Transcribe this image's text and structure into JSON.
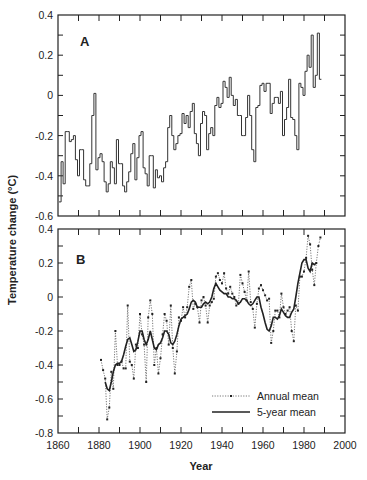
{
  "chart_data": [
    {
      "panel": "A",
      "type": "line",
      "style": "step",
      "title": "A",
      "xlabel": "Year",
      "ylabel": "Temperature change (°C)",
      "xlim": [
        1860,
        2000
      ],
      "ylim": [
        -0.6,
        0.4
      ],
      "yticks": [
        0.4,
        0.2,
        0,
        -0.2,
        -0.4,
        -0.6
      ],
      "ytick_labels": [
        "0.4",
        "0.2",
        "0",
        "-0.2",
        "-0.4",
        "-0.6"
      ],
      "grid": false,
      "series": [
        {
          "name": "Annual",
          "x": [
            1861,
            1862,
            1863,
            1864,
            1865,
            1866,
            1867,
            1868,
            1869,
            1870,
            1871,
            1872,
            1873,
            1874,
            1875,
            1876,
            1877,
            1878,
            1879,
            1880,
            1881,
            1882,
            1883,
            1884,
            1885,
            1886,
            1887,
            1888,
            1889,
            1890,
            1891,
            1892,
            1893,
            1894,
            1895,
            1896,
            1897,
            1898,
            1899,
            1900,
            1901,
            1902,
            1903,
            1904,
            1905,
            1906,
            1907,
            1908,
            1909,
            1910,
            1911,
            1912,
            1913,
            1914,
            1915,
            1916,
            1917,
            1918,
            1919,
            1920,
            1921,
            1922,
            1923,
            1924,
            1925,
            1926,
            1927,
            1928,
            1929,
            1930,
            1931,
            1932,
            1933,
            1934,
            1935,
            1936,
            1937,
            1938,
            1939,
            1940,
            1941,
            1942,
            1943,
            1944,
            1945,
            1946,
            1947,
            1948,
            1949,
            1950,
            1951,
            1952,
            1953,
            1954,
            1955,
            1956,
            1957,
            1958,
            1959,
            1960,
            1961,
            1962,
            1963,
            1964,
            1965,
            1966,
            1967,
            1968,
            1969,
            1970,
            1971,
            1972,
            1973,
            1974,
            1975,
            1976,
            1977,
            1978,
            1979,
            1980,
            1981,
            1982,
            1983,
            1984,
            1985,
            1986,
            1987,
            1988
          ],
          "values": [
            -0.53,
            -0.33,
            -0.44,
            -0.18,
            -0.18,
            -0.23,
            -0.22,
            -0.2,
            -0.32,
            -0.4,
            -0.27,
            -0.27,
            -0.42,
            -0.45,
            -0.45,
            -0.34,
            -0.1,
            0.01,
            -0.37,
            -0.31,
            -0.29,
            -0.33,
            -0.43,
            -0.48,
            -0.44,
            -0.33,
            -0.36,
            -0.44,
            -0.22,
            -0.34,
            -0.34,
            -0.45,
            -0.48,
            -0.43,
            -0.38,
            -0.29,
            -0.24,
            -0.42,
            -0.31,
            -0.2,
            -0.18,
            -0.36,
            -0.39,
            -0.45,
            -0.3,
            -0.3,
            -0.46,
            -0.37,
            -0.41,
            -0.4,
            -0.43,
            -0.36,
            -0.33,
            -0.16,
            -0.1,
            -0.2,
            -0.27,
            -0.24,
            -0.2,
            -0.19,
            -0.09,
            -0.14,
            -0.1,
            -0.16,
            -0.08,
            -0.04,
            -0.19,
            -0.24,
            -0.3,
            -0.14,
            -0.08,
            -0.1,
            -0.27,
            -0.19,
            -0.16,
            -0.2,
            -0.05,
            -0.01,
            -0.06,
            -0.04,
            0.07,
            0.04,
            -0.01,
            0.09,
            0.0,
            -0.05,
            -0.02,
            -0.1,
            -0.1,
            -0.2,
            -0.2,
            -0.11,
            0.0,
            -0.1,
            -0.27,
            -0.33,
            -0.06,
            -0.05,
            0.05,
            0.06,
            0.02,
            0.06,
            0.06,
            -0.09,
            -0.04,
            -0.01,
            -0.01,
            -0.04,
            0.02,
            -0.2,
            -0.12,
            -0.06,
            0.08,
            -0.11,
            -0.12,
            -0.2,
            -0.27,
            0.06,
            0.04,
            0.0,
            0.12,
            0.2,
            0.14,
            0.3,
            0.04,
            0.1,
            0.31,
            0.08,
            0.13,
            0.22,
            0.33
          ]
        }
      ]
    },
    {
      "panel": "B",
      "type": "line",
      "title": "B",
      "xlabel": "Year",
      "ylabel": "Temperature change (°C)",
      "xlim": [
        1860,
        2000
      ],
      "ylim": [
        -0.8,
        0.4
      ],
      "xticks": [
        1860,
        1880,
        1900,
        1920,
        1940,
        1960,
        1980,
        2000
      ],
      "xtick_labels": [
        "1860",
        "1880",
        "1900",
        "1920",
        "1940",
        "1960",
        "1980",
        "2000"
      ],
      "yticks": [
        0.4,
        0.2,
        0,
        -0.2,
        -0.4,
        -0.6,
        -0.8
      ],
      "ytick_labels": [
        "0.4",
        "0.2",
        "0",
        "-0.2",
        "-0.4",
        "-0.6",
        "-0.8"
      ],
      "grid": false,
      "legend_position": "lower right",
      "series": [
        {
          "name": "Annual mean",
          "style": "dotted with markers",
          "x": [
            1881,
            1882,
            1883,
            1884,
            1885,
            1886,
            1887,
            1888,
            1889,
            1890,
            1891,
            1892,
            1893,
            1894,
            1895,
            1896,
            1897,
            1898,
            1899,
            1900,
            1901,
            1902,
            1903,
            1904,
            1905,
            1906,
            1907,
            1908,
            1909,
            1910,
            1911,
            1912,
            1913,
            1914,
            1915,
            1916,
            1917,
            1918,
            1919,
            1920,
            1921,
            1922,
            1923,
            1924,
            1925,
            1926,
            1927,
            1928,
            1929,
            1930,
            1931,
            1932,
            1933,
            1934,
            1935,
            1936,
            1937,
            1938,
            1939,
            1940,
            1941,
            1942,
            1943,
            1944,
            1945,
            1946,
            1947,
            1948,
            1949,
            1950,
            1951,
            1952,
            1953,
            1954,
            1955,
            1956,
            1957,
            1958,
            1959,
            1960,
            1961,
            1962,
            1963,
            1964,
            1965,
            1966,
            1967,
            1968,
            1969,
            1970,
            1971,
            1972,
            1973,
            1974,
            1975,
            1976,
            1977,
            1978,
            1979,
            1980,
            1981,
            1982,
            1983,
            1984,
            1985,
            1986,
            1987,
            1988
          ],
          "values": [
            -0.37,
            -0.43,
            -0.48,
            -0.72,
            -0.65,
            -0.44,
            -0.54,
            -0.2,
            -0.4,
            -0.4,
            -0.38,
            -0.42,
            -0.42,
            -0.05,
            -0.38,
            -0.4,
            -0.48,
            -0.28,
            -0.3,
            -0.1,
            -0.22,
            -0.28,
            -0.5,
            -0.12,
            -0.02,
            -0.1,
            -0.4,
            -0.3,
            -0.45,
            -0.36,
            -0.22,
            -0.1,
            -0.14,
            -0.28,
            -0.05,
            -0.3,
            -0.45,
            -0.32,
            -0.12,
            -0.14,
            -0.06,
            -0.12,
            -0.06,
            0.06,
            0.1,
            -0.07,
            -0.04,
            -0.06,
            -0.15,
            -0.02,
            0.0,
            -0.05,
            -0.15,
            -0.05,
            -0.03,
            -0.01,
            0.12,
            0.14,
            0.1,
            0.08,
            0.14,
            0.05,
            0.02,
            0.06,
            0.02,
            0.0,
            -0.05,
            -0.04,
            0.13,
            0.08,
            0.03,
            -0.02,
            0.15,
            -0.03,
            -0.07,
            -0.18,
            -0.04,
            0.05,
            0.07,
            0.04,
            0.01,
            -0.02,
            -0.01,
            -0.27,
            -0.2,
            -0.08,
            -0.08,
            -0.12,
            0.02,
            -0.06,
            -0.1,
            -0.08,
            -0.06,
            -0.2,
            -0.26,
            -0.05,
            -0.08,
            0.12,
            0.12,
            0.15,
            0.23,
            0.36,
            0.31,
            0.16,
            0.07,
            0.2,
            0.3,
            0.35
          ]
        },
        {
          "name": "5-year mean",
          "style": "solid",
          "x": [
            1883,
            1884,
            1885,
            1886,
            1887,
            1888,
            1889,
            1890,
            1891,
            1892,
            1893,
            1894,
            1895,
            1896,
            1897,
            1898,
            1899,
            1900,
            1901,
            1902,
            1903,
            1904,
            1905,
            1906,
            1907,
            1908,
            1909,
            1910,
            1911,
            1912,
            1913,
            1914,
            1915,
            1916,
            1917,
            1918,
            1919,
            1920,
            1921,
            1922,
            1923,
            1924,
            1925,
            1926,
            1927,
            1928,
            1929,
            1930,
            1931,
            1932,
            1933,
            1934,
            1935,
            1936,
            1937,
            1938,
            1939,
            1940,
            1941,
            1942,
            1943,
            1944,
            1945,
            1946,
            1947,
            1948,
            1949,
            1950,
            1951,
            1952,
            1953,
            1954,
            1955,
            1956,
            1957,
            1958,
            1959,
            1960,
            1961,
            1962,
            1963,
            1964,
            1965,
            1966,
            1967,
            1968,
            1969,
            1970,
            1971,
            1972,
            1973,
            1974,
            1975,
            1976,
            1977,
            1978,
            1979,
            1980,
            1981,
            1982,
            1983,
            1984,
            1985,
            1986
          ],
          "values": [
            -0.5,
            -0.54,
            -0.55,
            -0.5,
            -0.44,
            -0.4,
            -0.39,
            -0.39,
            -0.38,
            -0.34,
            -0.29,
            -0.25,
            -0.24,
            -0.28,
            -0.32,
            -0.31,
            -0.26,
            -0.2,
            -0.2,
            -0.25,
            -0.28,
            -0.25,
            -0.2,
            -0.25,
            -0.3,
            -0.31,
            -0.28,
            -0.27,
            -0.24,
            -0.2,
            -0.2,
            -0.22,
            -0.27,
            -0.28,
            -0.26,
            -0.22,
            -0.17,
            -0.13,
            -0.12,
            -0.11,
            -0.1,
            -0.07,
            -0.03,
            -0.02,
            -0.03,
            -0.06,
            -0.06,
            -0.06,
            -0.04,
            -0.03,
            -0.04,
            -0.03,
            0.0,
            0.05,
            0.08,
            0.06,
            0.04,
            0.03,
            0.02,
            0.02,
            0.0,
            0.0,
            -0.01,
            -0.01,
            -0.02,
            -0.04,
            -0.03,
            -0.01,
            -0.01,
            -0.02,
            -0.04,
            -0.05,
            -0.04,
            -0.02,
            0.0,
            0.0,
            -0.06,
            -0.1,
            -0.15,
            -0.19,
            -0.2,
            -0.17,
            -0.12,
            -0.12,
            -0.13,
            -0.11,
            -0.07,
            -0.09,
            -0.11,
            -0.12,
            -0.12,
            -0.09,
            -0.07,
            0.0,
            0.08,
            0.14,
            0.2,
            0.22,
            0.22,
            0.17,
            0.15,
            0.2,
            0.19,
            0.2
          ]
        }
      ]
    }
  ],
  "figure": {
    "panel_a_label": "A",
    "panel_b_label": "B",
    "y_axis_title": "Temperature change (°C)",
    "x_axis_title": "Year",
    "legend": {
      "annual_label": "Annual mean",
      "five_year_label": "5-year mean"
    }
  }
}
